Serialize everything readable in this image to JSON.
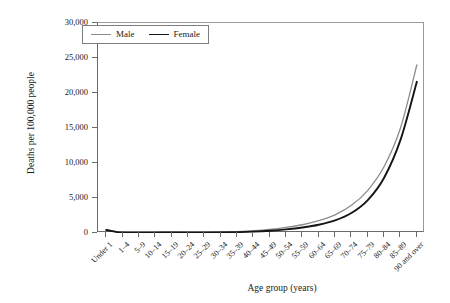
{
  "chart_data": {
    "type": "line",
    "title": "",
    "xlabel": "Age group (years)",
    "ylabel": "Deaths per 100,000 people",
    "ylim": [
      0,
      30000
    ],
    "yticks": [
      0,
      5000,
      10000,
      15000,
      20000,
      25000,
      30000
    ],
    "ytick_labels": [
      "0",
      "5,000",
      "10,000",
      "15,000",
      "20,000",
      "25,000",
      "30,000"
    ],
    "grid": false,
    "legend_position": "top-left",
    "categories": [
      "Under 1",
      "1–4",
      "5–9",
      "10–14",
      "15–19",
      "20–24",
      "25–29",
      "30–34",
      "35–39",
      "40–44",
      "45–49",
      "50–54",
      "55–59",
      "60–64",
      "65–69",
      "70–74",
      "75–79",
      "80–84",
      "85–89",
      "90 and over"
    ],
    "series": [
      {
        "name": "Male",
        "color": "#8c8c8c",
        "values": [
          520,
          30,
          15,
          18,
          75,
          110,
          125,
          150,
          210,
          320,
          500,
          790,
          1180,
          1760,
          2600,
          3950,
          6100,
          9500,
          15000,
          24000
        ]
      },
      {
        "name": "Female",
        "color": "#151515",
        "values": [
          430,
          25,
          12,
          13,
          40,
          45,
          55,
          75,
          120,
          200,
          330,
          520,
          790,
          1180,
          1800,
          2850,
          4700,
          7900,
          13300,
          21600
        ]
      }
    ]
  },
  "legend": {
    "items": [
      {
        "label": "Male"
      },
      {
        "label": "Female"
      }
    ]
  },
  "axes": {
    "y_title": "Deaths per 100,000 people",
    "x_title": "Age group (years)"
  }
}
